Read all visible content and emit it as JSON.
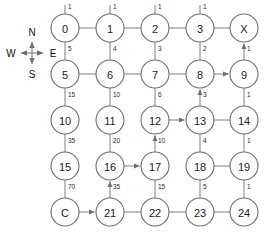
{
  "diagram": {
    "compass": {
      "name": "compass-rose",
      "north": "N",
      "east": "E",
      "south": "S",
      "west": "W",
      "cx": 32,
      "cy": 53
    },
    "colors": {
      "node_stroke": "#6e6e6e",
      "node_fill": "#ffffff",
      "edge_stroke": "#8a8a8a",
      "text": "#1a1a1a",
      "background": "#ffffff"
    },
    "geometry": {
      "col_x": [
        65,
        110,
        155,
        200,
        244
      ],
      "row_y": [
        28,
        74,
        120,
        166,
        212
      ],
      "radius": 14
    },
    "nodes": [
      {
        "id": "n0",
        "label": "0",
        "col": 0,
        "row": 0
      },
      {
        "id": "n1",
        "label": "1",
        "col": 1,
        "row": 0
      },
      {
        "id": "n2",
        "label": "2",
        "col": 2,
        "row": 0
      },
      {
        "id": "n3",
        "label": "3",
        "col": 3,
        "row": 0
      },
      {
        "id": "nX",
        "label": "X",
        "col": 4,
        "row": 0
      },
      {
        "id": "n5",
        "label": "5",
        "col": 0,
        "row": 1
      },
      {
        "id": "n6",
        "label": "6",
        "col": 1,
        "row": 1
      },
      {
        "id": "n7",
        "label": "7",
        "col": 2,
        "row": 1
      },
      {
        "id": "n8",
        "label": "8",
        "col": 3,
        "row": 1
      },
      {
        "id": "n9",
        "label": "9",
        "col": 4,
        "row": 1
      },
      {
        "id": "n10",
        "label": "10",
        "col": 0,
        "row": 2
      },
      {
        "id": "n11",
        "label": "11",
        "col": 1,
        "row": 2
      },
      {
        "id": "n12",
        "label": "12",
        "col": 2,
        "row": 2
      },
      {
        "id": "n13",
        "label": "13",
        "col": 3,
        "row": 2
      },
      {
        "id": "n14",
        "label": "14",
        "col": 4,
        "row": 2
      },
      {
        "id": "n15",
        "label": "15",
        "col": 0,
        "row": 3
      },
      {
        "id": "n16",
        "label": "16",
        "col": 1,
        "row": 3
      },
      {
        "id": "n17",
        "label": "17",
        "col": 2,
        "row": 3
      },
      {
        "id": "n18",
        "label": "18",
        "col": 3,
        "row": 3
      },
      {
        "id": "n19",
        "label": "19",
        "col": 4,
        "row": 3
      },
      {
        "id": "nC",
        "label": "C",
        "col": 0,
        "row": 4
      },
      {
        "id": "n21",
        "label": "21",
        "col": 1,
        "row": 4
      },
      {
        "id": "n22",
        "label": "22",
        "col": 2,
        "row": 4
      },
      {
        "id": "n23",
        "label": "23",
        "col": 3,
        "row": 4
      },
      {
        "id": "n24",
        "label": "24",
        "col": 4,
        "row": 4
      }
    ],
    "vertical_edges": [
      {
        "from": "n0",
        "to": "n5",
        "weight": "5",
        "weight_above_node": "n0",
        "weight_label": "1",
        "directed": false
      },
      {
        "from": "n1",
        "to": "n6",
        "weight": "4",
        "directed": false
      },
      {
        "from": "n2",
        "to": "n7",
        "weight": "3",
        "directed": false
      },
      {
        "from": "n3",
        "to": "n8",
        "weight": "2",
        "directed": false
      },
      {
        "from": "n9",
        "to": "nX",
        "weight": "1",
        "directed": true,
        "arrow": "up"
      },
      {
        "from": "n5",
        "to": "n10",
        "weight": "15",
        "directed": false
      },
      {
        "from": "n6",
        "to": "n11",
        "weight": "10",
        "directed": false
      },
      {
        "from": "n7",
        "to": "n12",
        "weight": "6",
        "directed": false
      },
      {
        "from": "n13",
        "to": "n8",
        "weight": "3",
        "directed": true,
        "arrow": "up"
      },
      {
        "from": "n9",
        "to": "n14",
        "weight": "1",
        "directed": false
      },
      {
        "from": "n10",
        "to": "n15",
        "weight": "35",
        "directed": false
      },
      {
        "from": "n11",
        "to": "n16",
        "weight": "20",
        "directed": false
      },
      {
        "from": "n17",
        "to": "n12",
        "weight": "10",
        "directed": true,
        "arrow": "up"
      },
      {
        "from": "n13",
        "to": "n18",
        "weight": "4",
        "directed": false
      },
      {
        "from": "n14",
        "to": "n19",
        "weight": "1",
        "directed": false
      },
      {
        "from": "n15",
        "to": "nC",
        "weight": "70",
        "directed": false
      },
      {
        "from": "n21",
        "to": "n16",
        "weight": "35",
        "directed": true,
        "arrow": "up"
      },
      {
        "from": "n22",
        "to": "n17",
        "weight": "15",
        "directed": false
      },
      {
        "from": "n23",
        "to": "n18",
        "weight": "5",
        "directed": false
      },
      {
        "from": "n24",
        "to": "n19",
        "weight": "1",
        "directed": false
      }
    ],
    "top_weights": [
      {
        "node": "n0",
        "weight": "1"
      },
      {
        "node": "n1",
        "weight": "1"
      },
      {
        "node": "n2",
        "weight": "1"
      },
      {
        "node": "n3",
        "weight": "1"
      }
    ],
    "horizontal_edges": [
      {
        "from": "n0",
        "to": "n1",
        "directed": false
      },
      {
        "from": "n1",
        "to": "n2",
        "directed": false
      },
      {
        "from": "n2",
        "to": "n3",
        "directed": false
      },
      {
        "from": "n3",
        "to": "nX",
        "directed": false
      },
      {
        "from": "n5",
        "to": "n6",
        "directed": false
      },
      {
        "from": "n6",
        "to": "n7",
        "directed": false
      },
      {
        "from": "n7",
        "to": "n8",
        "directed": false
      },
      {
        "from": "n8",
        "to": "n9",
        "directed": true
      },
      {
        "from": "n12",
        "to": "n13",
        "directed": true
      },
      {
        "from": "n13",
        "to": "n14",
        "directed": false
      },
      {
        "from": "n16",
        "to": "n17",
        "directed": true
      },
      {
        "from": "n18",
        "to": "n19",
        "directed": false
      },
      {
        "from": "nC",
        "to": "n21",
        "directed": true
      },
      {
        "from": "n21",
        "to": "n22",
        "directed": false
      },
      {
        "from": "n22",
        "to": "n23",
        "directed": false
      },
      {
        "from": "n23",
        "to": "n24",
        "directed": false
      }
    ]
  }
}
